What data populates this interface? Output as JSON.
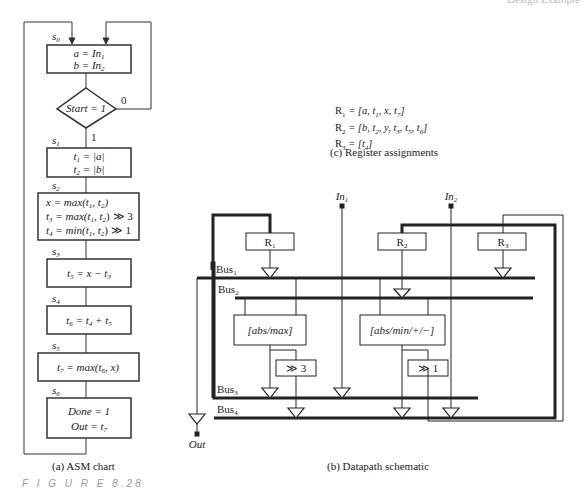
{
  "header_fragment": "Design Example",
  "asm_chart": {
    "caption": "(a)  ASM chart",
    "states": [
      {
        "name": "s0",
        "lines": [
          "a = In1",
          "b = In2"
        ]
      },
      {
        "name": "s1",
        "lines": [
          "t1 = |a|",
          "t2 = |b|"
        ]
      },
      {
        "name": "s2",
        "lines": [
          "x = max(t1, t2)",
          "t3 = max(t1, t2) ≫ 3",
          "t4 = min(t1, t2) ≫ 1"
        ]
      },
      {
        "name": "s3",
        "lines": [
          "t5 = x − t3"
        ]
      },
      {
        "name": "s4",
        "lines": [
          "t6 = t4 + t5"
        ]
      },
      {
        "name": "s5",
        "lines": [
          "t7 = max(t6, x)"
        ]
      },
      {
        "name": "s6",
        "lines": [
          "Done = 1",
          "Out = t7"
        ]
      }
    ],
    "decision": {
      "condition": "Start = 1",
      "true_label": "1",
      "false_label": "0"
    }
  },
  "register_assignments": {
    "caption": "(c)  Register assignments",
    "rows": [
      {
        "reg": "R",
        "sub": "1",
        "vars": "= [a, t1, x, t7]"
      },
      {
        "reg": "R",
        "sub": "2",
        "vars": "= [b, t2, y, t3, t5, t6]"
      },
      {
        "reg": "R",
        "sub": "3",
        "vars": "= [t4]"
      }
    ]
  },
  "datapath": {
    "caption": "(b)  Datapath schematic",
    "inputs": [
      "In1",
      "In2"
    ],
    "output": "Out",
    "registers": [
      "R1",
      "R2",
      "R3"
    ],
    "buses": [
      "Bus1",
      "Bus2",
      "Bus3",
      "Bus4"
    ],
    "units": [
      "[abs/max]",
      "[abs/min/+/−]"
    ],
    "shifters": [
      "≫ 3",
      "≫ 1"
    ]
  },
  "figure_label": "F I G U R E   8.28"
}
